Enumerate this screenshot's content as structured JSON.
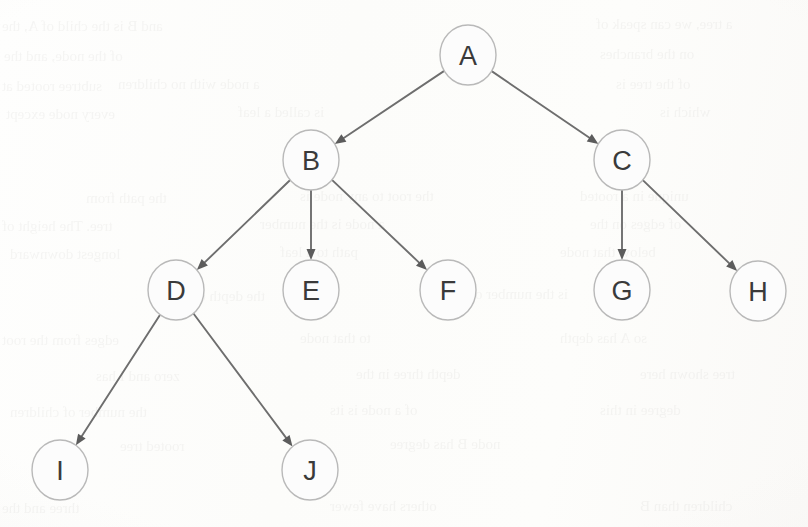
{
  "page": {
    "kind": "scanned-book-figure",
    "width": 808,
    "height": 527,
    "background_color": "#fdfdfc"
  },
  "style": {
    "node_fill": "#fcfcfc",
    "node_stroke": "#b9b9b9",
    "node_stroke_width": 1.4,
    "node_radius_x": 28,
    "node_radius_y": 30,
    "letter_color": "#3a3a3a",
    "letter_size": 27,
    "edge_color": "#6e6e6e",
    "edge_width": 1.9,
    "arrowhead_color": "#5c5c5c",
    "arrowhead_length": 11,
    "arrowhead_width": 9
  },
  "chart_data": {
    "type": "diagram",
    "subtype": "rooted-tree",
    "title": "",
    "directed": true,
    "root": "A",
    "node_count": 10,
    "edge_count": 9,
    "depth": 4,
    "nodes": [
      {
        "id": "A",
        "label": "A",
        "x": 468,
        "y": 55,
        "level": 0,
        "parent": null,
        "children": [
          "B",
          "C"
        ]
      },
      {
        "id": "B",
        "label": "B",
        "x": 311,
        "y": 160,
        "level": 1,
        "parent": "A",
        "children": [
          "D",
          "E",
          "F"
        ]
      },
      {
        "id": "C",
        "label": "C",
        "x": 622,
        "y": 160,
        "level": 1,
        "parent": "A",
        "children": [
          "G",
          "H"
        ]
      },
      {
        "id": "D",
        "label": "D",
        "x": 176,
        "y": 290,
        "level": 2,
        "parent": "B",
        "children": [
          "I",
          "J"
        ]
      },
      {
        "id": "E",
        "label": "E",
        "x": 311,
        "y": 290,
        "level": 2,
        "parent": "B",
        "children": []
      },
      {
        "id": "F",
        "label": "F",
        "x": 448,
        "y": 290,
        "level": 2,
        "parent": "B",
        "children": []
      },
      {
        "id": "G",
        "label": "G",
        "x": 622,
        "y": 290,
        "level": 2,
        "parent": "C",
        "children": []
      },
      {
        "id": "H",
        "label": "H",
        "x": 758,
        "y": 291,
        "level": 2,
        "parent": "C",
        "children": []
      },
      {
        "id": "I",
        "label": "I",
        "x": 60,
        "y": 470,
        "level": 3,
        "parent": "D",
        "children": []
      },
      {
        "id": "J",
        "label": "J",
        "x": 310,
        "y": 470,
        "level": 3,
        "parent": "D",
        "children": []
      }
    ],
    "edges": [
      {
        "from": "A",
        "to": "B"
      },
      {
        "from": "A",
        "to": "C"
      },
      {
        "from": "B",
        "to": "D"
      },
      {
        "from": "B",
        "to": "E"
      },
      {
        "from": "B",
        "to": "F"
      },
      {
        "from": "C",
        "to": "G"
      },
      {
        "from": "C",
        "to": "H"
      },
      {
        "from": "D",
        "to": "I"
      },
      {
        "from": "D",
        "to": "J"
      }
    ],
    "leaves": [
      "E",
      "F",
      "G",
      "H",
      "I",
      "J"
    ]
  },
  "bleed_through": {
    "note": "faint mirrored text showing through from the reverse side of the scanned page",
    "lines": [
      {
        "text": "and B is the child of A, the",
        "x": 2,
        "y": 18,
        "size": 15
      },
      {
        "text": "a tree, we can speak of",
        "x": 596,
        "y": 16,
        "size": 15
      },
      {
        "text": "of the node, and the",
        "x": 4,
        "y": 48,
        "size": 15
      },
      {
        "text": "on the branches",
        "x": 600,
        "y": 46,
        "size": 15
      },
      {
        "text": "subtree rooted at",
        "x": 2,
        "y": 78,
        "size": 15
      },
      {
        "text": "a node with no children",
        "x": 118,
        "y": 76,
        "size": 15
      },
      {
        "text": "of the tree is",
        "x": 616,
        "y": 76,
        "size": 15
      },
      {
        "text": "every node except",
        "x": 6,
        "y": 106,
        "size": 15
      },
      {
        "text": "is called a leaf",
        "x": 238,
        "y": 104,
        "size": 15
      },
      {
        "text": "which is",
        "x": 660,
        "y": 104,
        "size": 15
      },
      {
        "text": "the path from",
        "x": 86,
        "y": 190,
        "size": 15
      },
      {
        "text": "the root to any node is",
        "x": 300,
        "y": 188,
        "size": 15
      },
      {
        "text": "unique in a rooted",
        "x": 580,
        "y": 188,
        "size": 15
      },
      {
        "text": "tree. The height of",
        "x": 2,
        "y": 218,
        "size": 15
      },
      {
        "text": "a node is the number",
        "x": 260,
        "y": 216,
        "size": 15
      },
      {
        "text": "of edges on the",
        "x": 590,
        "y": 216,
        "size": 15
      },
      {
        "text": "longest downward",
        "x": 10,
        "y": 246,
        "size": 15
      },
      {
        "text": "path to a leaf",
        "x": 280,
        "y": 244,
        "size": 15
      },
      {
        "text": "below that node",
        "x": 560,
        "y": 244,
        "size": 15
      },
      {
        "text": "the depth of a node",
        "x": 150,
        "y": 288,
        "size": 15
      },
      {
        "text": "is the number of",
        "x": 470,
        "y": 286,
        "size": 15
      },
      {
        "text": "edges from the root",
        "x": 2,
        "y": 332,
        "size": 15
      },
      {
        "text": "to that node",
        "x": 300,
        "y": 330,
        "size": 15
      },
      {
        "text": "so A has depth",
        "x": 560,
        "y": 330,
        "size": 15
      },
      {
        "text": "zero and I has",
        "x": 96,
        "y": 368,
        "size": 15
      },
      {
        "text": "depth three in the",
        "x": 356,
        "y": 366,
        "size": 15
      },
      {
        "text": "tree shown here",
        "x": 640,
        "y": 366,
        "size": 15
      },
      {
        "text": "the number of children",
        "x": 10,
        "y": 404,
        "size": 15
      },
      {
        "text": "of a node is its",
        "x": 330,
        "y": 402,
        "size": 15
      },
      {
        "text": "degree in this",
        "x": 600,
        "y": 402,
        "size": 15
      },
      {
        "text": "rooted tree",
        "x": 120,
        "y": 438,
        "size": 15
      },
      {
        "text": "node B has degree",
        "x": 390,
        "y": 436,
        "size": 15
      },
      {
        "text": "three and the",
        "x": 2,
        "y": 500,
        "size": 15
      },
      {
        "text": "others have fewer",
        "x": 330,
        "y": 498,
        "size": 15
      },
      {
        "text": "children than B",
        "x": 640,
        "y": 498,
        "size": 15
      }
    ]
  }
}
